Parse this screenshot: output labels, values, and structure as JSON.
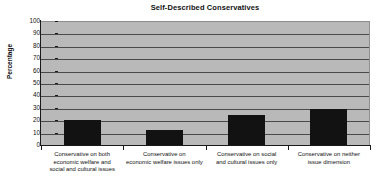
{
  "chart_data": {
    "type": "bar",
    "title": "Self-Described Conservatives",
    "xlabel": "",
    "ylabel": "Percentage",
    "ylim": [
      0,
      100
    ],
    "ytick_step": 10,
    "yticks": [
      100,
      90,
      80,
      70,
      60,
      50,
      40,
      30,
      20,
      10,
      0
    ],
    "ytick_labels": [
      "100",
      "90",
      "80",
      "70",
      "60",
      "50",
      "40",
      "30",
      "20",
      "10",
      "0"
    ],
    "grid": true,
    "legend": false,
    "categories": [
      "Conservative on both economic welfare and social and cultural issues",
      "Conservative on economic welfare issues only",
      "Conservative on social and cultural issues only",
      "Conservative on neither issue dimension"
    ],
    "category_lines": [
      [
        "Conservative on both",
        "economic welfare and",
        "social and cultural issues"
      ],
      [
        "Conservative on",
        "economic welfare issues only"
      ],
      [
        "Conservative on social",
        "and cultural issues only"
      ],
      [
        "Conservative on neither",
        "issue dimension"
      ]
    ],
    "values": [
      20,
      12,
      24,
      29
    ],
    "bar_color": "#121212",
    "plot_background": "#b9b9b9",
    "gridline_color": "#4a4a4a",
    "axis_color": "#1a1a1a"
  }
}
